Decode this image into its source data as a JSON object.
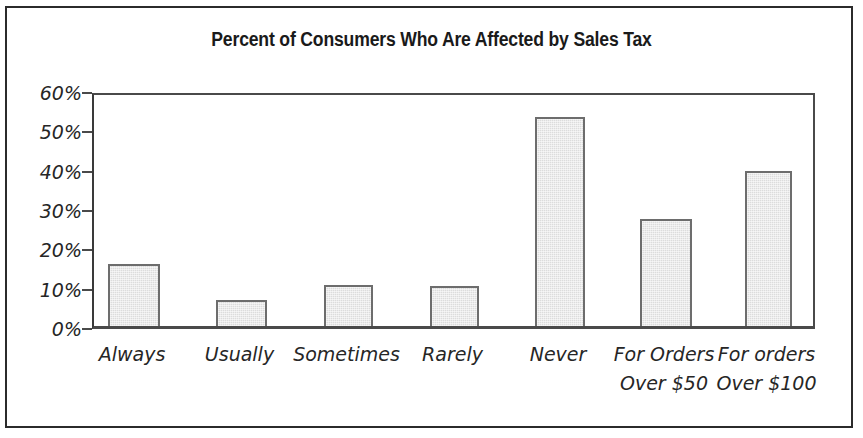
{
  "chart_data": {
    "type": "bar",
    "title": "Percent of Consumers Who Are Affected by Sales Tax",
    "xlabel": "",
    "ylabel": "",
    "categories": [
      "Always",
      "Usually",
      "Sometimes",
      "Rarely",
      "Never",
      "For Orders\nOver $50",
      "For orders\nOver $100"
    ],
    "values": [
      15.8,
      6.5,
      10.4,
      10.1,
      53.2,
      27.3,
      39.3
    ],
    "ylim": [
      0,
      60
    ],
    "yticks": [
      0,
      10,
      20,
      30,
      40,
      50,
      60
    ],
    "ytick_labels": [
      "0%",
      "10%",
      "20%",
      "30%",
      "40%",
      "50%",
      "60%"
    ],
    "grid": false,
    "legend": false,
    "bar_fill_color": "#dcdcdc",
    "bar_edge_color": "#6d6d6d",
    "axis_color": "#4a4a4a",
    "text_color": "#262626"
  }
}
